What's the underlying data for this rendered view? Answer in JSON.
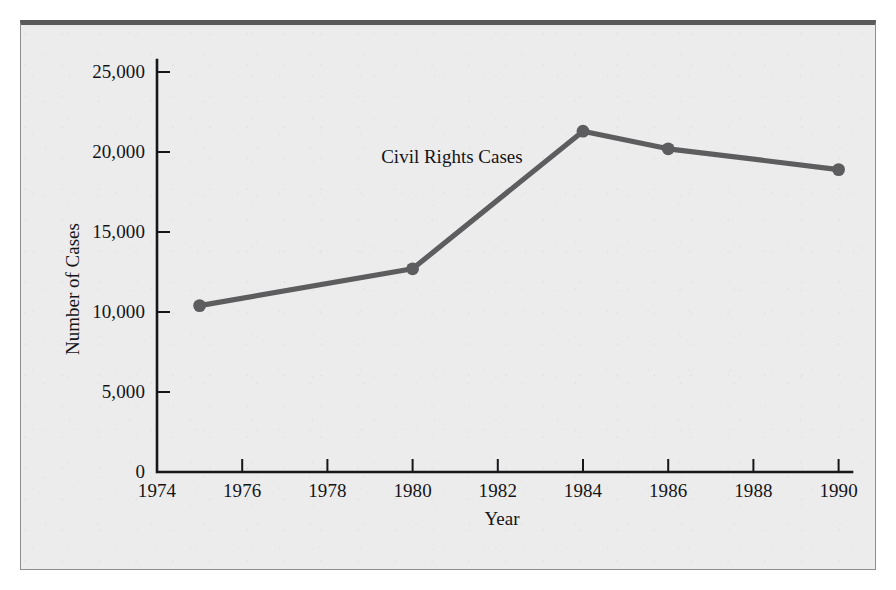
{
  "figure": {
    "background_color": "#ececed",
    "frame_color": "#5b5b5d",
    "series_color": "#5d5d60",
    "axis_color": "#17171a"
  },
  "chart_data": {
    "type": "line",
    "title": "",
    "subtitle": "",
    "xlabel": "Year",
    "ylabel": "Number of Cases",
    "xlim": [
      1974,
      1991
    ],
    "ylim": [
      0,
      26500
    ],
    "grid": false,
    "legend_position": "inline-annotation",
    "annotations": [
      {
        "text": "Civil Rights Cases",
        "x": 1981.0,
        "y": 19600
      }
    ],
    "xticks": [
      1974,
      1976,
      1978,
      1980,
      1982,
      1984,
      1986,
      1988,
      1990
    ],
    "xtick_labels": [
      "1974",
      "1976",
      "1978",
      "1980",
      "1982",
      "1984",
      "1986",
      "1988",
      "1990"
    ],
    "yticks": [
      0,
      5000,
      10000,
      15000,
      20000,
      25000
    ],
    "ytick_labels": [
      "0",
      "5,000",
      "10,000",
      "15,000",
      "20,000",
      "25,000"
    ],
    "series": [
      {
        "name": "Civil Rights Cases",
        "marker": "circle",
        "x": [
          1975,
          1980,
          1984,
          1986,
          1990
        ],
        "values": [
          10400,
          12700,
          21300,
          20200,
          18900
        ]
      }
    ]
  }
}
